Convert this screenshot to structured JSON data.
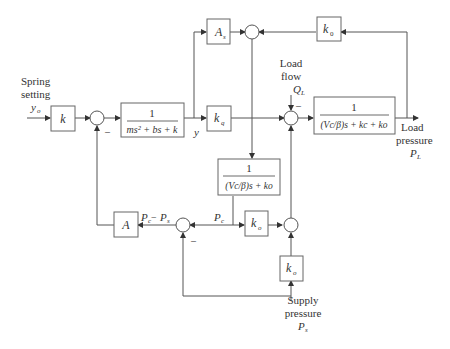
{
  "inputs": {
    "spring_setting": {
      "line1": "Spring",
      "line2": "setting",
      "symbol": "y",
      "sub": "o"
    },
    "load_flow": {
      "line1": "Load",
      "line2": "flow",
      "symbol": "Q",
      "sub": "L"
    },
    "supply_pressure": {
      "line1": "Supply",
      "line2": "pressure",
      "symbol": "P",
      "sub": "s"
    }
  },
  "outputs": {
    "load_pressure": {
      "line1": "Load",
      "line2": "pressure",
      "symbol": "P",
      "sub": "L"
    }
  },
  "blocks": {
    "k": "k",
    "spool": {
      "num": "1",
      "den": "ms² + bs + k"
    },
    "As": {
      "sym": "A",
      "sub": "s"
    },
    "kq": {
      "sym": "k",
      "sub": "q"
    },
    "k0_top": {
      "sym": "k",
      "sub": "0"
    },
    "load": {
      "num": "1",
      "den": "(Vc/β)s + kc + ko"
    },
    "chamber": {
      "num": "1",
      "den": "(Vc/β)s + ko"
    },
    "ko_mid": {
      "sym": "k",
      "sub": "o"
    },
    "ko_bottom": {
      "sym": "k",
      "sub": "o"
    },
    "A": "A"
  },
  "signals": {
    "y": "y",
    "Pc": {
      "sym": "P",
      "sub": "c"
    },
    "Pc_minus_Ps": {
      "a": "P",
      "asub": "c",
      "op": " − ",
      "b": "P",
      "bsub": "s"
    }
  },
  "signs": {
    "minus": "–"
  }
}
